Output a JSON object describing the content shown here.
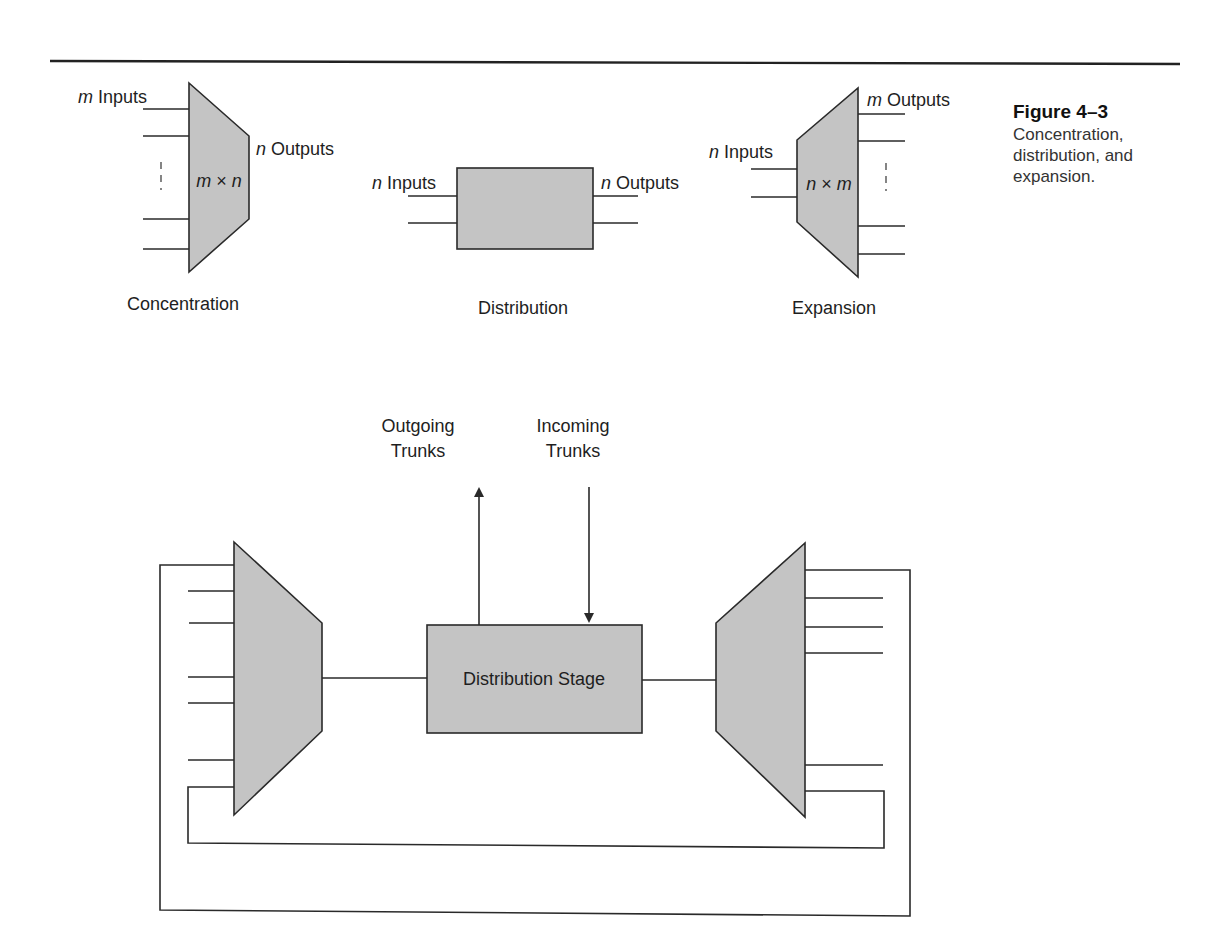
{
  "caption": {
    "title": "Figure 4–3",
    "lines": [
      "Concentration,",
      "distribution, and",
      "expansion."
    ]
  },
  "concentration": {
    "inputs_var": "m",
    "inputs_label": " Inputs",
    "outputs_var": "n",
    "outputs_label": " Outputs",
    "size_a": "m",
    "size_op": " × ",
    "size_b": "n",
    "title": "Concentration"
  },
  "distribution": {
    "inputs_var": "n",
    "inputs_label": " Inputs",
    "outputs_var": "n",
    "outputs_label": " Outputs",
    "title": "Distribution"
  },
  "expansion": {
    "inputs_var": "n",
    "inputs_label": " Inputs",
    "outputs_var": "m",
    "outputs_label": " Outputs",
    "size_a": "n",
    "size_op": " × ",
    "size_b": "m",
    "title": "Expansion"
  },
  "network": {
    "outgoing_line1": "Outgoing",
    "outgoing_line2": "Trunks",
    "incoming_line1": "Incoming",
    "incoming_line2": "Trunks",
    "stage_label": "Distribution Stage"
  },
  "colors": {
    "shape_fill": "#c4c4c4",
    "stroke": "#2a2a2a"
  }
}
